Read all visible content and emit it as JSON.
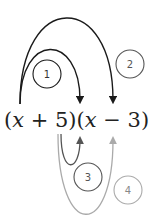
{
  "expression": {
    "open1": "(",
    "var1": "x",
    "op1": " + 5)(",
    "var2": "x",
    "op2": " − 3)"
  },
  "steps": [
    {
      "number": "1",
      "from": "x",
      "to": "x",
      "color": "#1a1a1a"
    },
    {
      "number": "2",
      "from": "x",
      "to": "-3",
      "color": "#1a1a1a"
    },
    {
      "number": "3",
      "from": "5",
      "to": "x",
      "color": "#555555"
    },
    {
      "number": "4",
      "from": "5",
      "to": "-3",
      "color": "#aaaaaa"
    }
  ],
  "colors": {
    "dark": "#1a1a1a",
    "mid": "#555555",
    "light": "#aaaaaa"
  }
}
